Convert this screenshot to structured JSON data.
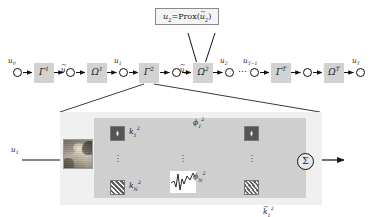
{
  "figure": {
    "type": "unrolled-network-diagram",
    "callout": {
      "text": "u₂=Prox(ŭ₂)",
      "main": "u",
      "sub": "2",
      "fn": "Prox",
      "arg": "ŭ₂"
    }
  },
  "chain": {
    "nodes": [
      {
        "id": "u0",
        "label": "u₀",
        "base": "u",
        "sub": "0",
        "tilde": false
      },
      {
        "id": "ut1",
        "label": "ŭ₁",
        "base": "u",
        "sub": "1",
        "tilde": true
      },
      {
        "id": "u1",
        "label": "u₁",
        "base": "u",
        "sub": "1",
        "tilde": false
      },
      {
        "id": "ut2",
        "label": "ŭ₂",
        "base": "u",
        "sub": "2",
        "tilde": true
      },
      {
        "id": "u2",
        "label": "u₂",
        "base": "u",
        "sub": "2",
        "tilde": false
      },
      {
        "id": "utm1",
        "label": "u_{T-1}",
        "base": "u",
        "sub": "T−1",
        "tilde": false
      },
      {
        "id": "utT",
        "label": "ŭ_T",
        "base": "u",
        "sub": "T",
        "tilde": true
      },
      {
        "id": "uT",
        "label": "u_T",
        "base": "u",
        "sub": "T",
        "tilde": false
      }
    ],
    "operators": [
      {
        "id": "gamma1",
        "base": "Γ",
        "sup": "1",
        "label": "Γ¹"
      },
      {
        "id": "omega1",
        "base": "Ω",
        "sup": "1",
        "label": "Ω¹"
      },
      {
        "id": "gamma2",
        "base": "Γ",
        "sup": "2",
        "label": "Γ²"
      },
      {
        "id": "omega2",
        "base": "Ω",
        "sup": "2",
        "label": "Ω²"
      },
      {
        "id": "gammaT",
        "base": "Γ",
        "sup": "T",
        "label": "Γᵀ"
      },
      {
        "id": "omegaT",
        "base": "Ω",
        "sup": "T",
        "label": "Ωᵀ"
      }
    ],
    "ellipsis": "⋯"
  },
  "detail": {
    "input": {
      "base": "u",
      "sub": "1",
      "label": "u₁"
    },
    "output": {
      "base": "u",
      "sub": "2",
      "tilde": true,
      "label": "ŭ₂"
    },
    "sigma": "Σ",
    "vdots": "⋮",
    "branches": [
      {
        "kernel": {
          "base": "k",
          "sub": "1",
          "sup": "2",
          "label": "k₁²"
        },
        "phi": {
          "base": "ϕ",
          "sub": "1",
          "sup": "2",
          "label": "ϕ₁²"
        },
        "kernel2": {
          "base": "k̃",
          "sub": "1",
          "sup": "2",
          "label": "k̃₁²"
        }
      },
      {
        "kernel": {
          "base": "k",
          "sub": "N",
          "sup": "2",
          "label": "k_N²"
        },
        "phi": {
          "base": "ϕ",
          "sub": "N",
          "sup": "2",
          "label": "ϕ_N²"
        },
        "kernel2": {
          "base": "k̃",
          "sub": "N",
          "sup": "2",
          "label": "k̃_N²"
        }
      }
    ]
  },
  "colors": {
    "operator_box": "#d2d2d2",
    "panel_outer": "#f0f0f0",
    "panel_inner": "#cfcfcf",
    "stroke": "#111111",
    "callout_bg": "#f4f4f4",
    "callout_border": "#8a8a8a"
  }
}
